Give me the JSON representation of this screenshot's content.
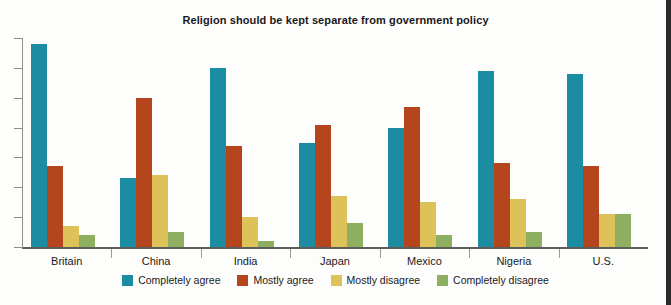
{
  "chart_data": {
    "type": "bar",
    "title": "Religion should be kept separate from government policy",
    "xlabel": "",
    "ylabel": "",
    "ylim": [
      0,
      70
    ],
    "grid": false,
    "legend_position": "bottom",
    "categories": [
      "Britain",
      "China",
      "India",
      "Japan",
      "Mexico",
      "Nigeria",
      "U.S."
    ],
    "series": [
      {
        "name": "Completely agree",
        "color": "#1c8ca3",
        "values": [
          68,
          23,
          60,
          35,
          40,
          59,
          58
        ]
      },
      {
        "name": "Mostly agree",
        "color": "#b4451d",
        "values": [
          27,
          50,
          34,
          41,
          47,
          28,
          27
        ]
      },
      {
        "name": "Mostly disagree",
        "color": "#ddc159",
        "values": [
          7,
          24,
          10,
          17,
          15,
          16,
          11
        ]
      },
      {
        "name": "Completely disagree",
        "color": "#8eae60",
        "values": [
          4,
          5,
          2,
          8,
          4,
          5,
          11
        ]
      }
    ],
    "y_tick_count": 8,
    "axis_labels_visible": false
  },
  "legend": {
    "items": [
      {
        "label": "Completely agree",
        "color": "#1c8ca3"
      },
      {
        "label": "Mostly agree",
        "color": "#b4451d"
      },
      {
        "label": "Mostly disagree",
        "color": "#ddc159"
      },
      {
        "label": "Completely disagree",
        "color": "#8eae60"
      }
    ]
  }
}
